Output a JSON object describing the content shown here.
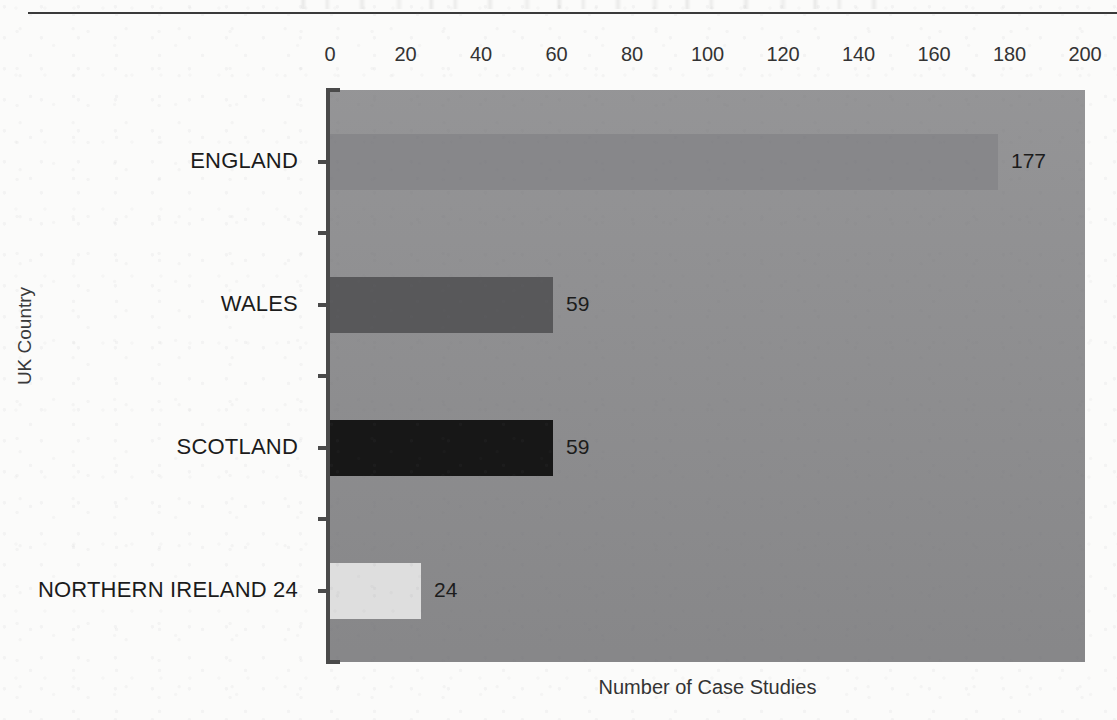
{
  "chart_data": {
    "type": "bar",
    "orientation": "horizontal",
    "title": "",
    "categories": [
      "ENGLAND",
      "WALES",
      "SCOTLAND",
      "NORTHERN IRELAND 24"
    ],
    "values": [
      177,
      59,
      59,
      24
    ],
    "value_labels": [
      "177",
      "59",
      "59",
      "24"
    ],
    "xlabel": "Number of Case Studies",
    "ylabel": "UK Country",
    "xlim": [
      0,
      200
    ],
    "xticks": [
      0,
      20,
      40,
      60,
      80,
      100,
      120,
      140,
      160,
      180,
      200
    ],
    "xtick_labels": [
      "0",
      "20",
      "40",
      "60",
      "80",
      "100",
      "120",
      "140",
      "160",
      "180",
      "200"
    ],
    "xaxis_position": "top",
    "grid": false,
    "legend": "none",
    "bar_colors": [
      "#87878a",
      "#58585a",
      "#171717",
      "#dedede"
    ],
    "plot_background": "#8e8e90",
    "page_background": "#fbfbfa",
    "axis_color": "#4a4a4a"
  },
  "axes": {
    "x_title": "Number of Case Studies",
    "y_title": "UK Country"
  },
  "bars": [
    {
      "label": "ENGLAND",
      "value": 177,
      "value_text": "177",
      "color": "#87878a"
    },
    {
      "label": "WALES",
      "value": 59,
      "value_text": "59",
      "color": "#58585a"
    },
    {
      "label": "SCOTLAND",
      "value": 59,
      "value_text": "59",
      "color": "#171717"
    },
    {
      "label": "NORTHERN IRELAND 24",
      "value": 24,
      "value_text": "24",
      "color": "#dedede"
    }
  ],
  "xticks": [
    {
      "value": 0,
      "text": "0"
    },
    {
      "value": 20,
      "text": "20"
    },
    {
      "value": 40,
      "text": "40"
    },
    {
      "value": 60,
      "text": "60"
    },
    {
      "value": 80,
      "text": "80"
    },
    {
      "value": 100,
      "text": "100"
    },
    {
      "value": 120,
      "text": "120"
    },
    {
      "value": 140,
      "text": "140"
    },
    {
      "value": 160,
      "text": "160"
    },
    {
      "value": 180,
      "text": "180"
    },
    {
      "value": 200,
      "text": "200"
    }
  ]
}
